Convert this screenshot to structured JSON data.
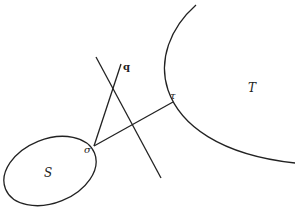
{
  "diagram": {
    "labels": {
      "S": "S",
      "T": "T",
      "sigma": "σ",
      "tau": "τ",
      "q": "q"
    },
    "colors": {
      "stroke": "#222222",
      "background": "#ffffff"
    },
    "shapes": [
      {
        "name": "set-S-ellipse",
        "type": "ellipse"
      },
      {
        "name": "set-T-arc",
        "type": "arc"
      },
      {
        "name": "segment-sigma-tau",
        "type": "line"
      },
      {
        "name": "segment-sigma-q",
        "type": "line"
      },
      {
        "name": "separating-line",
        "type": "line"
      }
    ]
  }
}
